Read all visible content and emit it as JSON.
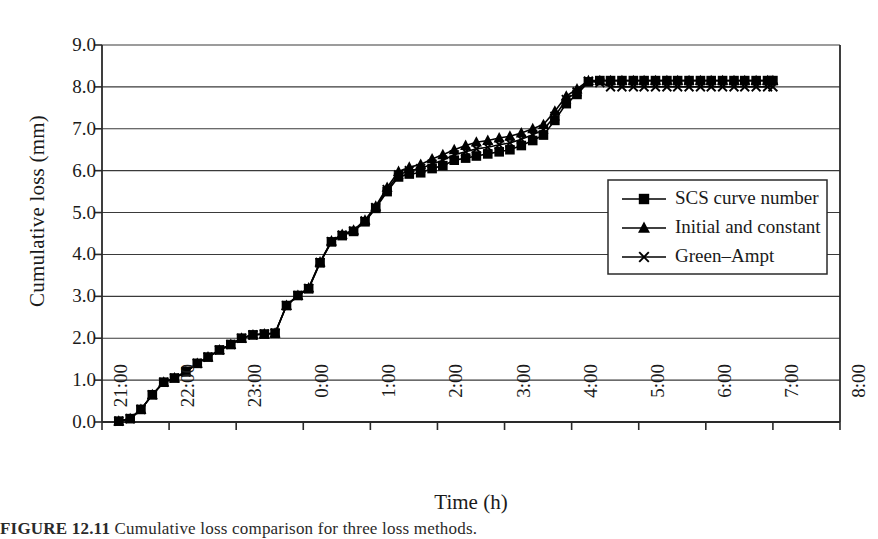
{
  "figure": {
    "caption_prefix": "FIGURE 12.11",
    "caption_rest": "Cumulative loss comparison for three loss methods."
  },
  "chart_data": {
    "type": "line",
    "title": "",
    "xlabel": "Time (h)",
    "ylabel": "Cumulative loss (mm)",
    "grid": "horizontal",
    "legend_position": "inside-right",
    "x_tick_labels": [
      "21:00",
      "22:00",
      "23:00",
      "0:00",
      "1:00",
      "2:00",
      "3:00",
      "4:00",
      "5:00",
      "6:00",
      "7:00",
      "8:00"
    ],
    "x_tick_hours": [
      0,
      1,
      2,
      3,
      4,
      5,
      6,
      7,
      8,
      9,
      10,
      11
    ],
    "xlim": [
      0,
      11
    ],
    "y_tick_labels": [
      "0.0",
      "1.0",
      "2.0",
      "3.0",
      "4.0",
      "5.0",
      "6.0",
      "7.0",
      "8.0",
      "9.0"
    ],
    "y_tick_values": [
      0.0,
      1.0,
      2.0,
      3.0,
      4.0,
      5.0,
      6.0,
      7.0,
      8.0,
      9.0
    ],
    "ylim": [
      0,
      9
    ],
    "series": [
      {
        "name": "SCS curve number",
        "marker": "square",
        "color": "#000000",
        "x": [
          0.25,
          0.42,
          0.58,
          0.75,
          0.92,
          1.08,
          1.25,
          1.42,
          1.58,
          1.75,
          1.92,
          2.08,
          2.25,
          2.42,
          2.58,
          2.75,
          2.92,
          3.08,
          3.25,
          3.42,
          3.58,
          3.75,
          3.92,
          4.08,
          4.25,
          4.42,
          4.58,
          4.75,
          4.92,
          5.08,
          5.25,
          5.42,
          5.58,
          5.75,
          5.92,
          6.08,
          6.25,
          6.42,
          6.58,
          6.75,
          6.92,
          7.08,
          7.25,
          7.42,
          7.58,
          7.75,
          7.92,
          8.08,
          8.25,
          8.42,
          8.58,
          8.75,
          8.92,
          9.08,
          9.25,
          9.42,
          9.58,
          9.75,
          9.92,
          10.0
        ],
        "y": [
          0.02,
          0.08,
          0.3,
          0.65,
          0.95,
          1.05,
          1.2,
          1.4,
          1.55,
          1.72,
          1.85,
          2.0,
          2.08,
          2.1,
          2.12,
          2.78,
          3.02,
          3.18,
          3.8,
          4.3,
          4.45,
          4.55,
          4.78,
          5.1,
          5.5,
          5.85,
          5.92,
          5.95,
          6.05,
          6.12,
          6.25,
          6.3,
          6.35,
          6.4,
          6.45,
          6.5,
          6.6,
          6.72,
          6.85,
          7.2,
          7.6,
          7.82,
          8.12,
          8.15,
          8.15,
          8.15,
          8.15,
          8.15,
          8.15,
          8.15,
          8.15,
          8.15,
          8.15,
          8.15,
          8.15,
          8.15,
          8.15,
          8.15,
          8.15,
          8.15
        ]
      },
      {
        "name": "Initial and constant",
        "marker": "triangle",
        "color": "#000000",
        "x": [
          0.25,
          0.42,
          0.58,
          0.75,
          0.92,
          1.08,
          1.25,
          1.42,
          1.58,
          1.75,
          1.92,
          2.08,
          2.25,
          2.42,
          2.58,
          2.75,
          2.92,
          3.08,
          3.25,
          3.42,
          3.58,
          3.75,
          3.92,
          4.08,
          4.25,
          4.42,
          4.58,
          4.75,
          4.92,
          5.08,
          5.25,
          5.42,
          5.58,
          5.75,
          5.92,
          6.08,
          6.25,
          6.42,
          6.58,
          6.75,
          6.92,
          7.08,
          7.25,
          7.42,
          7.58,
          7.75,
          7.92,
          8.08,
          8.25,
          8.42,
          8.58,
          8.75,
          8.92,
          9.08,
          9.25,
          9.42,
          9.58,
          9.75,
          9.92,
          10.0
        ],
        "y": [
          0.02,
          0.08,
          0.3,
          0.65,
          0.95,
          1.05,
          1.2,
          1.4,
          1.55,
          1.72,
          1.85,
          2.0,
          2.08,
          2.1,
          2.12,
          2.78,
          3.02,
          3.2,
          3.82,
          4.32,
          4.48,
          4.58,
          4.82,
          5.15,
          5.6,
          5.98,
          6.08,
          6.15,
          6.28,
          6.38,
          6.5,
          6.6,
          6.68,
          6.72,
          6.78,
          6.82,
          6.9,
          7.0,
          7.1,
          7.42,
          7.78,
          7.95,
          8.15,
          8.15,
          8.15,
          8.15,
          8.15,
          8.15,
          8.15,
          8.15,
          8.15,
          8.15,
          8.15,
          8.15,
          8.15,
          8.15,
          8.15,
          8.15,
          8.15,
          8.15
        ]
      },
      {
        "name": "Green–Ampt",
        "marker": "cross",
        "color": "#000000",
        "x": [
          0.25,
          0.42,
          0.58,
          0.75,
          0.92,
          1.08,
          1.25,
          1.42,
          1.58,
          1.75,
          1.92,
          2.08,
          2.25,
          2.42,
          2.58,
          2.75,
          2.92,
          3.08,
          3.25,
          3.42,
          3.58,
          3.75,
          3.92,
          4.08,
          4.25,
          4.42,
          4.58,
          4.75,
          4.92,
          5.08,
          5.25,
          5.42,
          5.58,
          5.75,
          5.92,
          6.08,
          6.25,
          6.42,
          6.58,
          6.75,
          6.92,
          7.08,
          7.25,
          7.42,
          7.58,
          7.75,
          7.92,
          8.08,
          8.25,
          8.42,
          8.58,
          8.75,
          8.92,
          9.08,
          9.25,
          9.42,
          9.58,
          9.75,
          9.92,
          10.0
        ],
        "y": [
          0.02,
          0.08,
          0.3,
          0.65,
          0.95,
          1.05,
          1.2,
          1.4,
          1.55,
          1.72,
          1.85,
          2.0,
          2.08,
          2.1,
          2.12,
          2.78,
          3.02,
          3.19,
          3.81,
          4.31,
          4.46,
          4.56,
          4.8,
          5.12,
          5.55,
          5.9,
          6.0,
          6.05,
          6.16,
          6.25,
          6.38,
          6.45,
          6.52,
          6.56,
          6.62,
          6.66,
          6.75,
          6.86,
          6.98,
          7.3,
          7.7,
          7.88,
          8.14,
          8.1,
          8.0,
          8.0,
          8.0,
          8.0,
          8.0,
          8.0,
          8.0,
          8.0,
          8.0,
          8.0,
          8.0,
          8.0,
          8.0,
          8.0,
          8.0,
          8.0
        ]
      }
    ]
  },
  "legend": {
    "items": [
      {
        "label": "SCS curve number",
        "marker": "square"
      },
      {
        "label": "Initial and constant",
        "marker": "triangle"
      },
      {
        "label": "Green–Ampt",
        "marker": "cross"
      }
    ]
  }
}
